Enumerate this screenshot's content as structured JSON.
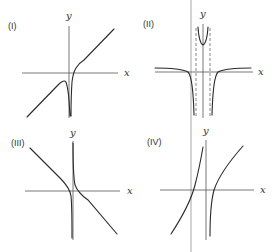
{
  "figure": {
    "panels": [
      {
        "id": "I",
        "label": "(I)",
        "x_axis_label": "x",
        "y_axis_label": "y",
        "description": "Oblique asymptote with vertical asymptote just right of y-axis; curve dips to -infinity on both sides"
      },
      {
        "id": "II",
        "label": "(II)",
        "x_axis_label": "x",
        "y_axis_label": "y",
        "description": "Two dashed vertical asymptotes symmetric about y-axis; U-shaped branch between them going up, outer branches approach horizontal asymptote from above and fall to -infinity"
      },
      {
        "id": "III",
        "label": "(III)",
        "x_axis_label": "x",
        "y_axis_label": "y",
        "description": "Decreasing branches with vertical asymptote just right of y-axis"
      },
      {
        "id": "IV",
        "label": "(IV)",
        "x_axis_label": "x",
        "y_axis_label": "y",
        "description": "Increasing branches with vertical asymptote just right of y-axis"
      }
    ]
  },
  "colors": {
    "curve": "#2a2a2a",
    "axis": "#555555",
    "divider": "#c8c8c8"
  }
}
